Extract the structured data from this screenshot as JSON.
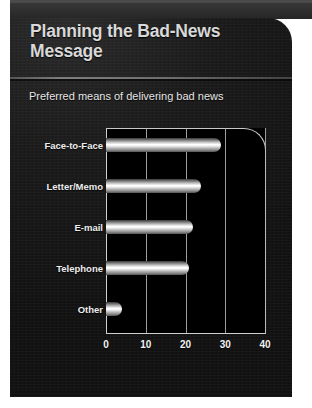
{
  "slide": {
    "title": "Planning the Bad-News Message",
    "subtitle": "Preferred means of delivering bad news",
    "panel_color": "#141414",
    "title_color": "#d9d9d9",
    "bar_color": "#ffffff"
  },
  "chart_data": {
    "type": "bar",
    "orientation": "horizontal",
    "title": "Preferred means of delivering bad news",
    "categories": [
      "Face-to-Face",
      "Letter/Memo",
      "E-mail",
      "Telephone",
      "Other"
    ],
    "values": [
      29,
      24,
      22,
      21,
      4
    ],
    "xlabel": "",
    "ylabel": "",
    "xlim": [
      0,
      40
    ],
    "xticks": [
      0,
      10,
      20,
      30,
      40
    ],
    "xtick_labels": [
      "0",
      "10",
      "20",
      "30",
      "40"
    ],
    "grid": true,
    "legend": false
  }
}
